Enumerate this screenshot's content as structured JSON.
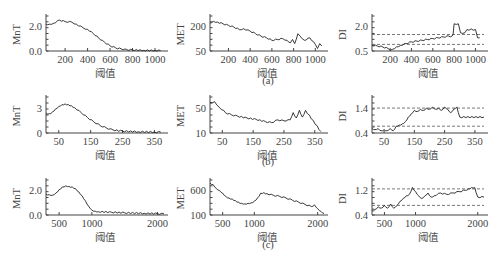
{
  "chart_data": [
    {
      "panel": "a",
      "caption": "(a)",
      "charts": [
        {
          "type": "line",
          "ylabel": "MnT",
          "xlabel": "阈值",
          "xticks": [
            200,
            400,
            600,
            800,
            1000
          ],
          "yticks": [
            "0.0",
            "2.0"
          ],
          "xlim": [
            30,
            1080
          ],
          "ylim": [
            0,
            3.2
          ],
          "x": [
            30,
            60,
            100,
            150,
            200,
            260,
            300,
            360,
            400,
            450,
            500,
            550,
            600,
            650,
            700,
            750,
            800,
            900,
            1000,
            1050
          ],
          "y": [
            2.6,
            2.6,
            2.7,
            3.0,
            2.85,
            2.8,
            2.6,
            2.25,
            2.1,
            1.7,
            1.25,
            0.85,
            0.5,
            0.3,
            0.2,
            0.12,
            0.1,
            0.06,
            0.05,
            0.04
          ]
        },
        {
          "type": "line",
          "ylabel": "MET",
          "xlabel": "阈值",
          "xticks": [
            200,
            400,
            600,
            800,
            1000
          ],
          "yticks": [
            "50",
            "200"
          ],
          "xlim": [
            30,
            1080
          ],
          "ylim": [
            30,
            230
          ],
          "x": [
            30,
            60,
            100,
            150,
            200,
            250,
            300,
            340,
            400,
            450,
            500,
            550,
            600,
            650,
            700,
            740,
            770,
            790,
            810,
            840,
            860,
            900,
            950,
            1000,
            1020,
            1040,
            1060
          ],
          "y": [
            200,
            210,
            205,
            195,
            185,
            175,
            160,
            165,
            150,
            135,
            120,
            110,
            95,
            100,
            105,
            95,
            80,
            100,
            75,
            135,
            120,
            95,
            110,
            70,
            45,
            75,
            60
          ]
        },
        {
          "type": "line",
          "ylabel": "DI",
          "xlabel": "阈值",
          "xticks": [
            200,
            400,
            600,
            800,
            1000
          ],
          "yticks": [
            "0.5",
            "2.0"
          ],
          "xlim": [
            30,
            1080
          ],
          "ylim": [
            0.2,
            2.2
          ],
          "hlines": [
            0.6,
            1.2
          ],
          "x": [
            30,
            80,
            130,
            180,
            200,
            220,
            260,
            300,
            350,
            400,
            450,
            500,
            550,
            600,
            650,
            700,
            750,
            780,
            790,
            800,
            840,
            860,
            900,
            920,
            1000,
            1020,
            1040
          ],
          "y": [
            0.55,
            0.5,
            0.45,
            0.35,
            0.25,
            0.3,
            0.45,
            0.55,
            0.65,
            0.75,
            0.8,
            0.85,
            0.9,
            0.95,
            1.0,
            1.05,
            1.1,
            1.1,
            1.2,
            1.85,
            1.85,
            1.3,
            1.3,
            1.5,
            1.5,
            1.0,
            1.0
          ]
        }
      ]
    },
    {
      "panel": "b",
      "caption": "(b)",
      "charts": [
        {
          "type": "line",
          "ylabel": "MnT",
          "xlabel": "阈值",
          "xticks": [
            50,
            150,
            250,
            350
          ],
          "yticks": [
            "0",
            "3"
          ],
          "xlim": [
            10,
            380
          ],
          "ylim": [
            0,
            5.5
          ],
          "x": [
            10,
            20,
            30,
            40,
            50,
            60,
            70,
            80,
            90,
            100,
            120,
            140,
            160,
            180,
            200,
            220,
            250,
            300,
            350,
            370
          ],
          "y": [
            3.2,
            3.1,
            3.4,
            3.9,
            4.3,
            4.6,
            4.7,
            4.6,
            4.4,
            4.1,
            3.3,
            2.5,
            1.8,
            1.2,
            0.8,
            0.5,
            0.3,
            0.2,
            0.15,
            0.15
          ]
        },
        {
          "type": "line",
          "ylabel": "MET",
          "xlabel": "阈值",
          "xticks": [
            50,
            150,
            250,
            350
          ],
          "yticks": [
            "10",
            "50"
          ],
          "xlim": [
            10,
            380
          ],
          "ylim": [
            5,
            80
          ],
          "x": [
            10,
            25,
            40,
            60,
            80,
            100,
            130,
            160,
            190,
            210,
            230,
            250,
            270,
            280,
            290,
            300,
            310,
            320,
            370
          ],
          "y": [
            72,
            74,
            62,
            50,
            45,
            42,
            38,
            35,
            30,
            28,
            34,
            32,
            34,
            50,
            38,
            55,
            40,
            55,
            8
          ]
        },
        {
          "type": "line",
          "ylabel": "DI",
          "xlabel": "阈值",
          "xticks": [
            50,
            150,
            250,
            350
          ],
          "yticks": [
            "0.4",
            "1.4"
          ],
          "xlim": [
            10,
            380
          ],
          "ylim": [
            0.3,
            1.8
          ],
          "hlines": [
            0.6,
            1.4
          ],
          "x": [
            10,
            20,
            30,
            40,
            50,
            60,
            70,
            80,
            90,
            100,
            110,
            120,
            130,
            140,
            150,
            160,
            170,
            180,
            190,
            200,
            210,
            220,
            230,
            240,
            250,
            260,
            270,
            280,
            290,
            300,
            380
          ],
          "y": [
            0.5,
            0.45,
            0.5,
            0.4,
            0.45,
            0.4,
            0.5,
            0.4,
            0.6,
            0.65,
            0.7,
            0.8,
            1.0,
            1.15,
            1.3,
            1.25,
            1.35,
            1.3,
            1.4,
            1.35,
            1.45,
            1.35,
            1.4,
            1.3,
            1.45,
            1.35,
            1.2,
            1.35,
            1.45,
            1.0,
            1.0
          ]
        }
      ]
    },
    {
      "panel": "c",
      "caption": "(c)",
      "charts": [
        {
          "type": "line",
          "ylabel": "MnT",
          "xlabel": "阈值",
          "xticks": [
            500,
            1000,
            2000
          ],
          "yticks": [
            "0.0",
            "2.0"
          ],
          "xlim": [
            300,
            2100
          ],
          "ylim": [
            0,
            3.0
          ],
          "x": [
            300,
            350,
            400,
            450,
            500,
            550,
            600,
            650,
            700,
            750,
            800,
            850,
            900,
            950,
            1000,
            1050,
            1100,
            1300,
            1500,
            1800,
            2000,
            2100
          ],
          "y": [
            1.9,
            1.85,
            1.8,
            2.0,
            2.3,
            2.55,
            2.65,
            2.6,
            2.55,
            2.4,
            2.1,
            1.75,
            1.3,
            0.8,
            0.45,
            0.35,
            0.3,
            0.25,
            0.2,
            0.15,
            0.12,
            0.1
          ]
        },
        {
          "type": "line",
          "ylabel": "MET",
          "xlabel": "阈值",
          "xticks": [
            500,
            1000,
            2000
          ],
          "yticks": [
            "100",
            "600"
          ],
          "xlim": [
            300,
            2100
          ],
          "ylim": [
            80,
            700
          ],
          "x": [
            300,
            350,
            400,
            450,
            500,
            550,
            600,
            650,
            700,
            750,
            800,
            850,
            900,
            950,
            1000,
            1050,
            1100,
            1150,
            1200,
            1300,
            1400,
            1500,
            1600,
            1700,
            1800,
            1900,
            1950,
            2000,
            2050,
            2100
          ],
          "y": [
            680,
            650,
            580,
            540,
            490,
            430,
            400,
            380,
            350,
            320,
            300,
            290,
            300,
            310,
            340,
            400,
            490,
            500,
            480,
            450,
            430,
            400,
            360,
            320,
            280,
            240,
            270,
            200,
            150,
            110
          ]
        },
        {
          "type": "line",
          "ylabel": "DI",
          "xlabel": "阈值",
          "xticks": [
            500,
            1000,
            2000
          ],
          "yticks": [
            "0.4",
            "1.2"
          ],
          "xlim": [
            300,
            2100
          ],
          "ylim": [
            0.3,
            1.5
          ],
          "hlines": [
            0.65,
            1.25
          ],
          "x": [
            300,
            350,
            400,
            450,
            500,
            550,
            600,
            650,
            700,
            750,
            800,
            850,
            900,
            950,
            1000,
            1050,
            1100,
            1150,
            1200,
            1250,
            1300,
            1400,
            1500,
            1600,
            1700,
            1800,
            1850,
            1900,
            1950,
            2000,
            2100
          ],
          "y": [
            0.45,
            0.5,
            0.6,
            0.55,
            0.65,
            0.55,
            0.7,
            0.55,
            0.65,
            0.8,
            0.9,
            1.0,
            1.05,
            1.3,
            1.15,
            1.0,
            0.9,
            1.0,
            1.1,
            0.95,
            1.0,
            1.1,
            1.05,
            1.1,
            1.15,
            1.2,
            1.25,
            1.3,
            1.3,
            0.95,
            0.95
          ]
        }
      ]
    }
  ]
}
